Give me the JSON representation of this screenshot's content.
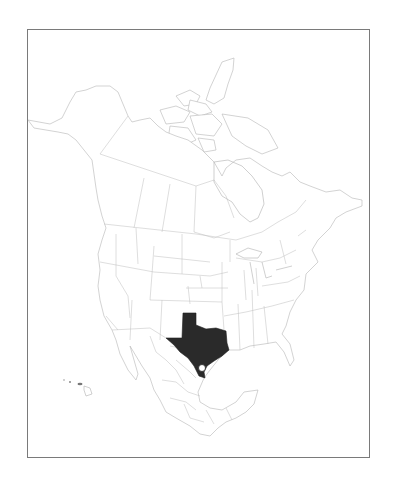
{
  "map": {
    "region": "North America",
    "projection_frame": {
      "x": 27,
      "y": 29,
      "width": 343,
      "height": 429,
      "border_color": "#7a7a7a"
    },
    "highlighted_regions": [
      {
        "name": "Texas",
        "fill": "#2a2a2a"
      }
    ],
    "markers": [
      {
        "type": "open-circle",
        "fill": "#ffffff",
        "stroke": "#1e1e1e",
        "x": 202,
        "y": 368,
        "r": 3.5
      }
    ],
    "base_fill": "#ffffff",
    "boundary_color": "#b5b5b5",
    "insets": [
      "Hawaii"
    ]
  }
}
